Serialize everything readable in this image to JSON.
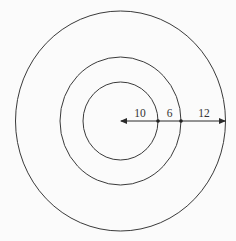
{
  "diagram": {
    "type": "concentric-circles",
    "center": {
      "x": 120.5,
      "y": 121
    },
    "circles": [
      {
        "name": "inner",
        "rx": 37.5,
        "ry": 39
      },
      {
        "name": "middle",
        "rx": 60.5,
        "ry": 64
      },
      {
        "name": "outer",
        "rx": 105,
        "ry": 110
      }
    ],
    "radial_segments": [
      {
        "label": "10",
        "from": "center",
        "to": "inner"
      },
      {
        "label": "6",
        "from": "inner",
        "to": "middle"
      },
      {
        "label": "12",
        "from": "middle",
        "to": "outer"
      }
    ],
    "stroke_color": "#3a3a3a",
    "background_color": "#fbfbfb"
  }
}
